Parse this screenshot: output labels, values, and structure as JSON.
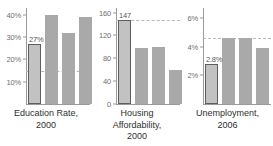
{
  "chart_data": [
    {
      "type": "bar",
      "title": "Education Rate, 2000",
      "title_lines": [
        "Education Rate,",
        "2000"
      ],
      "categories": [
        "1",
        "2",
        "3",
        "4"
      ],
      "values": [
        27,
        40,
        32,
        39
      ],
      "value_label": "27%",
      "highlight_index": 0,
      "ylabel": "",
      "xlabel": "",
      "ylim": [
        0,
        43
      ],
      "ticks": [
        40,
        30,
        20,
        10
      ],
      "tick_labels": [
        "40%",
        "30%",
        "20%",
        "10%"
      ],
      "reference_line": 15,
      "grid": false,
      "legend": "none"
    },
    {
      "type": "bar",
      "title": "Housing Affordability, 2000",
      "title_lines": [
        "Housing",
        "Affordability,",
        "2000"
      ],
      "categories": [
        "1",
        "2",
        "3",
        "4"
      ],
      "values": [
        147,
        98,
        100,
        60
      ],
      "value_label": "147",
      "highlight_index": 0,
      "ylabel": "",
      "xlabel": "",
      "ylim": [
        0,
        168
      ],
      "ticks": [
        160,
        120,
        80,
        40,
        0
      ],
      "tick_labels": [
        "160",
        "120",
        "80",
        "40",
        "0"
      ],
      "reference_line": 147,
      "grid": false,
      "legend": "none"
    },
    {
      "type": "bar",
      "title": "Unemployment, 2006",
      "title_lines": [
        "Unemployment,",
        "2006"
      ],
      "categories": [
        "1",
        "2",
        "3",
        "4"
      ],
      "values": [
        2.8,
        4.6,
        4.6,
        3.9
      ],
      "value_label": "2.8%",
      "highlight_index": 0,
      "ylabel": "",
      "xlabel": "",
      "ylim": [
        0,
        6.7
      ],
      "ticks": [
        6,
        4,
        2
      ],
      "tick_labels": [
        "6%",
        "4%",
        "2%"
      ],
      "reference_line": 4.6,
      "grid": false,
      "legend": "none"
    }
  ],
  "colors": {
    "bar": "#a9a9a9",
    "bar_highlight_fill": "#c2c2c2",
    "bar_highlight_stroke": "#5d5d5d",
    "axis": "#9a9a9a",
    "reference_line": "#b9b9b9",
    "tick_text": "#6f6f6f",
    "caption_text": "#2f2f2f",
    "background": "#ffffff"
  }
}
